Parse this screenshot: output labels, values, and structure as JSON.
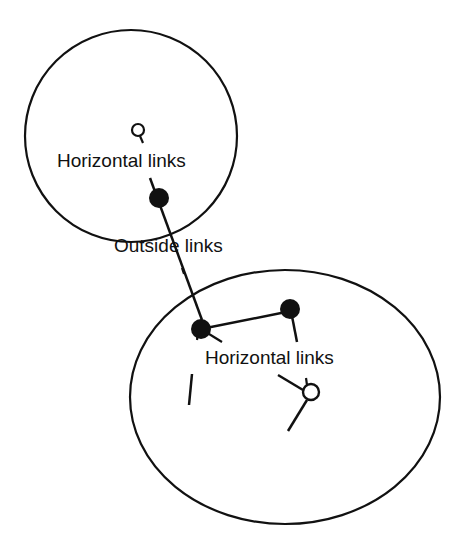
{
  "diagram": {
    "colors": {
      "stroke": "#111111",
      "background": "#ffffff"
    },
    "labels": {
      "top_horizontal": "Horizontal links",
      "outside": "Outside links",
      "bottom_horizontal": "Horizontal links"
    },
    "nodes": [
      {
        "id": "top-open",
        "filled": false
      },
      {
        "id": "top-boundary",
        "filled": true
      },
      {
        "id": "bottom-left",
        "filled": true
      },
      {
        "id": "bottom-right",
        "filled": true
      },
      {
        "id": "bottom-open",
        "filled": false
      }
    ]
  }
}
